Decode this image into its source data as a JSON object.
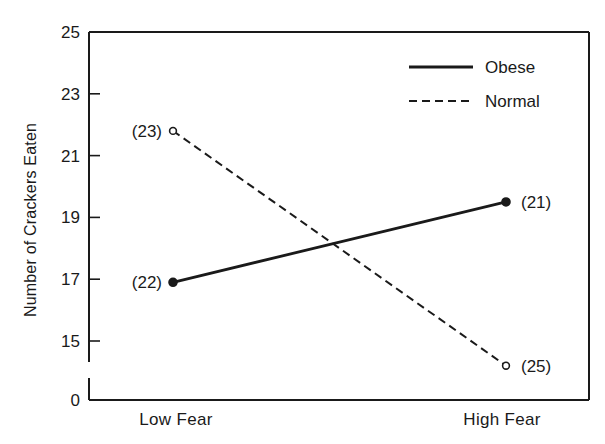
{
  "chart_data": {
    "type": "line",
    "title": "",
    "xlabel": "",
    "ylabel": "Number of Crackers Eaten",
    "categories": [
      "Low Fear",
      "High Fear"
    ],
    "ylim": [
      15,
      25
    ],
    "y_axis_break": true,
    "y_ticks": [
      0,
      15,
      17,
      19,
      21,
      23,
      25
    ],
    "grid": false,
    "legend_position": "upper right",
    "series": [
      {
        "name": "Obese",
        "line_style": "solid",
        "marker": "filled-circle",
        "values": [
          16.9,
          19.5
        ],
        "n_labels": [
          "(22)",
          "(21)"
        ]
      },
      {
        "name": "Normal",
        "line_style": "dashed",
        "marker": "open-circle",
        "values": [
          21.8,
          14.2
        ],
        "n_labels": [
          "(23)",
          "(25)"
        ]
      }
    ]
  },
  "colors": {
    "ink": "#1a1a1a",
    "background": "#ffffff"
  }
}
